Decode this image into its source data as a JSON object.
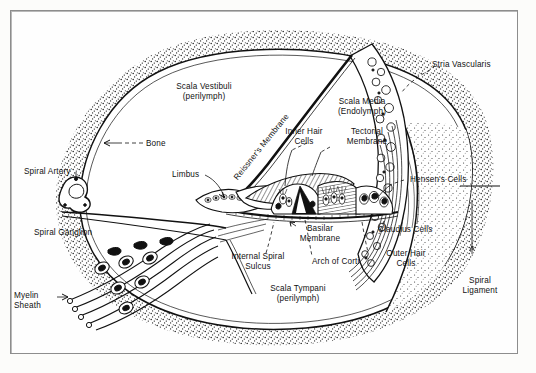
{
  "figure": {
    "frame_color": "#8d8d8d",
    "ink_color": "#111111",
    "paper_color": "#fefefe"
  },
  "labels": {
    "scala_vestibuli": "Scala Vestibuli\n(perilymph)",
    "bone": "Bone",
    "spiral_artery": "Spiral Artery",
    "spiral_ganglion": "Spiral Ganglion",
    "myelin_sheath": "Myelin\nSheath",
    "limbus": "Limbus",
    "reissners_membrane": "Reissner's Membrane",
    "scala_media": "Scala Media\n(Endolymph)",
    "stria_vascularis": "Stria Vascularis",
    "inner_hair_cells": "Inner Hair\nCells",
    "tectorial_membrane": "Tectorial\nMembrane",
    "hensens_cells": "Hensen's Cells",
    "claudius_cells": "Claudius Cells",
    "outer_hair_cells": "Outer Hair\nCells",
    "arch_of_corti": "Arch of Corti",
    "basilar_membrane": "Basilar\nMembrane",
    "internal_spiral_sulcus": "Internal Spiral\nSulcus",
    "scala_tympani": "Scala Tympani\n(perilymph)",
    "spiral_ligament": "Spiral\nLigament"
  }
}
